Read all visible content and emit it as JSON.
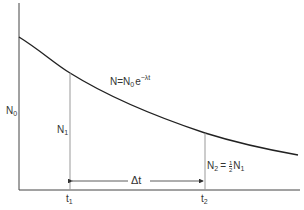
{
  "diagram": {
    "equation": {
      "lhs": "N",
      "eq": "=",
      "n0": "N",
      "n0_sub": "0",
      "e": "e",
      "exponent": "−λt"
    },
    "labels": {
      "n0": {
        "main": "N",
        "sub": "0"
      },
      "n1": {
        "main": "N",
        "sub": "1"
      },
      "n2": {
        "main": "N",
        "sub": "2",
        "eq": "=",
        "frac_num": "1",
        "frac_den": "2",
        "rhs_main": "N",
        "rhs_sub": "1"
      },
      "t1": {
        "main": "t",
        "sub": "1"
      },
      "t2": {
        "main": "t",
        "sub": "2"
      },
      "delta_t": "Δt"
    },
    "colors": {
      "curve": "#222222",
      "axes": "#444444",
      "guides": "#999999"
    }
  }
}
